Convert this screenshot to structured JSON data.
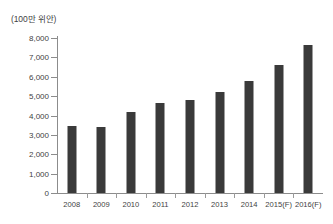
{
  "chart_data": {
    "type": "bar",
    "title": "",
    "subtitle": "",
    "unit_label": "(100만 위안)",
    "xlabel": "",
    "ylabel": "",
    "categories": [
      "2008",
      "2009",
      "2010",
      "2011",
      "2012",
      "2013",
      "2014",
      "2015(F)",
      "2016(F)"
    ],
    "values": [
      3450,
      3420,
      4200,
      4650,
      4800,
      5200,
      5800,
      6600,
      7650
    ],
    "series": [
      {
        "name": "",
        "values": [
          3450,
          3420,
          4200,
          4650,
          4800,
          5200,
          5800,
          6600,
          7650
        ]
      }
    ],
    "ylim": [
      0,
      8000
    ],
    "yticks": [
      0,
      1000,
      2000,
      3000,
      4000,
      5000,
      6000,
      7000,
      8000
    ],
    "ytick_labels": [
      "0",
      "1,000",
      "2,000",
      "3,000",
      "4,000",
      "5,000",
      "6,000",
      "7,000",
      "8,000"
    ],
    "grid": false,
    "legend": false,
    "legend_position": "none",
    "bar_color": "#3a3a3a",
    "axis_color": "#8c8c8c",
    "background_color": "#ffffff"
  }
}
